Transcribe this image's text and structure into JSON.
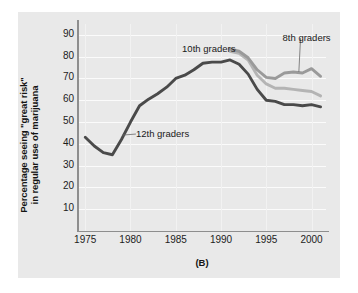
{
  "figure": {
    "caption": "(B)",
    "panel_color": "#e9e9e9"
  },
  "chart_data": {
    "type": "line",
    "title": "",
    "xlabel": "",
    "ylabel": "Percentage seeing \"great risk\" in regular use of marijuana",
    "ylabel_line1": "Percentage seeing \"great risk\"",
    "ylabel_line2": "in regular use of marijuana",
    "xlim": [
      1974.2,
      2001.6
    ],
    "ylim": [
      0,
      95
    ],
    "yticks": [
      10,
      20,
      30,
      40,
      50,
      60,
      70,
      80,
      90
    ],
    "xticks": [
      1975,
      1980,
      1985,
      1990,
      1995,
      2000
    ],
    "grid": "horizontal-and-vertical",
    "legend_position": "inline-annotations",
    "series": [
      {
        "name": "12th graders",
        "color": "#4a4a4a",
        "x": [
          1975,
          1976,
          1977,
          1978,
          1979,
          1980,
          1981,
          1982,
          1983,
          1984,
          1985,
          1986,
          1987,
          1988,
          1989,
          1990,
          1991,
          1992,
          1993,
          1994,
          1995,
          1996,
          1997,
          1998,
          1999,
          2000,
          2001
        ],
        "values": [
          43,
          39,
          36,
          35,
          42,
          50,
          57.5,
          60.5,
          63,
          66,
          70,
          71.5,
          74,
          77,
          77.5,
          77.5,
          78.5,
          76.5,
          72,
          65,
          60,
          59.5,
          58,
          58,
          57.5,
          58,
          57
        ]
      },
      {
        "name": "10th graders",
        "color": "#b4b4b4",
        "x": [
          1991,
          1992,
          1993,
          1994,
          1995,
          1996,
          1997,
          1998,
          1999,
          2000,
          2001
        ],
        "values": [
          82.5,
          81.5,
          78.5,
          71.5,
          67.5,
          65.5,
          65.5,
          65,
          64.5,
          64,
          62
        ]
      },
      {
        "name": "8th graders",
        "color": "#9a9a9a",
        "x": [
          1991,
          1992,
          1993,
          1994,
          1995,
          1996,
          1997,
          1998,
          1999,
          2000,
          2001
        ],
        "values": [
          83.5,
          82.5,
          79.5,
          74,
          70.5,
          70,
          72.5,
          73,
          72.5,
          74.5,
          71
        ]
      }
    ],
    "annotations": [
      {
        "text": "10th graders",
        "x": 1985.7,
        "y": 83.5,
        "leader_to_x": 1991.3,
        "leader_to_y": 82.5
      },
      {
        "text": "8th graders",
        "x": 1996.8,
        "y": 88.5,
        "leader_to_x": 1998.6,
        "leader_to_y": 73.0
      },
      {
        "text": "12th graders",
        "x": 1980.6,
        "y": 44.5,
        "leader_to_x": 1979.1,
        "leader_to_y": 44.0
      }
    ]
  }
}
